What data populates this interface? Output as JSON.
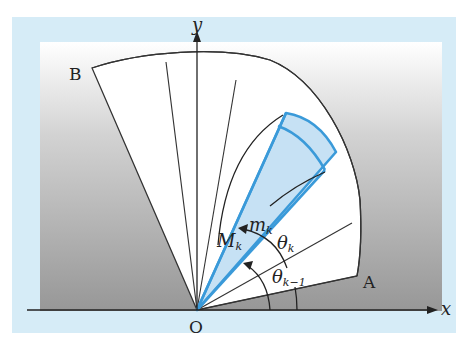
{
  "figure": {
    "colors": {
      "frame": "#d6ecf7",
      "panel_top": "#ffffff",
      "panel_bottom": "#9a9a9a",
      "region_fill": "#ffffff",
      "highlight_fill": "#bcdcf2",
      "highlight_stroke": "#3a9ad9",
      "line": "#222222"
    },
    "axes": {
      "x_label": "x",
      "y_label": "y",
      "origin_label": "O"
    },
    "points": {
      "A": "A",
      "B": "B"
    },
    "labels": {
      "M": "M",
      "M_sub": "k",
      "m": "m",
      "m_sub": "k",
      "theta_k": "θ",
      "theta_k_sub": "k",
      "theta_km1": "θ",
      "theta_km1_sub": "k−1"
    }
  }
}
